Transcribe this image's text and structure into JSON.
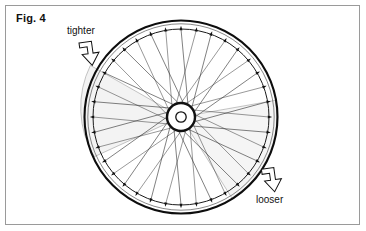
{
  "figure": {
    "caption": "Fig. 4",
    "width": 366,
    "height": 231,
    "background_color": "#ffffff",
    "frame": {
      "border_color": "#9a9a9a",
      "border_width": 1,
      "inset": 5
    }
  },
  "callouts": [
    {
      "id": "tighter",
      "label": "tighter",
      "arrow": "block-arrow-down-right",
      "label_x": 67,
      "label_y": 25,
      "points_to": "upper-left-rim-section"
    },
    {
      "id": "looser",
      "label": "looser",
      "arrow": "block-arrow-down-right",
      "label_x": 256,
      "label_y": 194,
      "points_to": "lower-right-rim-section"
    }
  ],
  "wheel": {
    "center_x": 181,
    "center_y": 117,
    "rim_outer_radius": 97,
    "rim_inner_radius": 88,
    "rim_stroke_color": "#111111",
    "spoke_color": "#333333",
    "spoke_count": 36,
    "nipple_count": 36,
    "lacing": "tangential-crossed",
    "hub": {
      "flange_radius": 14,
      "axle_radius": 5,
      "color": "#111111"
    },
    "highlight_sectors": [
      {
        "id": "tighter-sector",
        "label": "tighter",
        "start_angle_deg": 170,
        "end_angle_deg": 238,
        "fill": "#f2f2f2"
      },
      {
        "id": "looser-sector",
        "label": "looser",
        "start_angle_deg": 350,
        "end_angle_deg": 58,
        "fill": "#f4f4f4"
      }
    ]
  },
  "colors": {
    "ink": "#111111",
    "spoke": "#333333",
    "frame": "#9a9a9a",
    "shade": "#f2f2f2",
    "paper": "#ffffff"
  }
}
